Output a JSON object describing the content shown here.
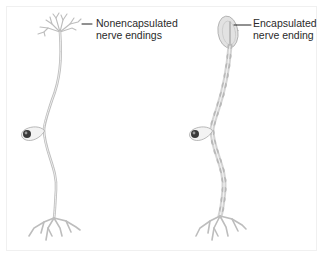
{
  "figure": {
    "left_neuron": {
      "label_lines": [
        "Nonencapsulated",
        "nerve endings"
      ]
    },
    "right_neuron": {
      "label_lines": [
        "Encapsulated",
        "nerve ending"
      ]
    },
    "colors": {
      "nerve_fiber": "#c8c8c8",
      "nerve_outline": "#b0b0b0",
      "capsule": "#d6d6d6",
      "nucleus": "#333333",
      "leader_line": "#222222",
      "text": "#2a2a2a"
    }
  }
}
